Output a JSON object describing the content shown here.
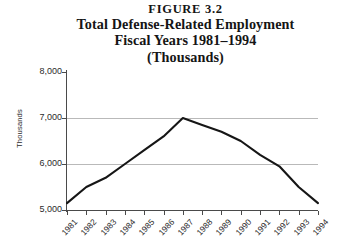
{
  "figure": {
    "number_label": "FIGURE 3.2",
    "title_main": "Total Defense-Related Employment",
    "title_years": "Fiscal Years 1981–1994",
    "title_units": "(Thousands)"
  },
  "chart_data": {
    "type": "line",
    "title": "Total Defense-Related Employment Fiscal Years 1981–1994 (Thousands)",
    "xlabel": "",
    "ylabel": "Thousands",
    "categories": [
      "1981",
      "1982",
      "1983",
      "1984",
      "1985",
      "1986",
      "1987",
      "1988",
      "1989",
      "1990",
      "1991",
      "1992",
      "1993",
      "1994"
    ],
    "values": [
      5150,
      5500,
      5700,
      6000,
      6300,
      6600,
      7000,
      6850,
      6700,
      6500,
      6200,
      5950,
      5500,
      5150
    ],
    "ylim": [
      5000,
      8000
    ],
    "yticks": [
      5000,
      6000,
      7000,
      8000
    ],
    "ytick_labels": [
      "5,000",
      "6,000",
      "7,000",
      "8,000"
    ],
    "grid": true,
    "gridlines_at": [
      6000,
      7000
    ],
    "legend": "none",
    "line_color": "#161616",
    "grid_color": "#b9b9b9",
    "axis_color": "#4a4a4a"
  }
}
